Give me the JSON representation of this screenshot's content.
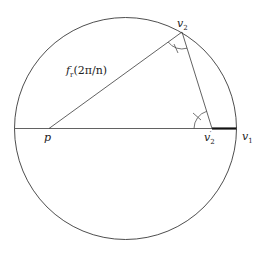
{
  "diagram": {
    "title": "",
    "colors": {
      "stroke": "#3a3a3a",
      "thick_segment": "#111111",
      "background": "#ffffff"
    },
    "circle": {
      "cx": 125.5,
      "cy": 128.5,
      "r": 111
    },
    "points": {
      "p": {
        "x": 49,
        "y": 128.5
      },
      "v2": {
        "x": 182,
        "y": 32
      },
      "v2_prime": {
        "x": 212,
        "y": 128.5
      },
      "v1": {
        "x": 236.5,
        "y": 128.5
      }
    },
    "labels": {
      "p": {
        "base": "p",
        "sub": "",
        "sup": ""
      },
      "v2": {
        "base": "v",
        "sub": "2",
        "sup": ""
      },
      "v2_prime": {
        "base": "v",
        "sub": "2",
        "sup": "′"
      },
      "v1": {
        "base": "v",
        "sub": "1",
        "sup": ""
      },
      "edge_p_v2": {
        "text": "f",
        "sub": "r",
        "rest": "(2π/n)"
      }
    },
    "angle_marks": [
      {
        "at": "v2",
        "description": "angle at v2 between p-v2 and v2-v2' with tick mark"
      },
      {
        "at": "v2_prime",
        "description": "angle at v2' between p-v2' and v2'-v2 with tick mark"
      }
    ],
    "segments": [
      {
        "from": "circle_left",
        "to": "v1",
        "style": "thin",
        "description": "diameter"
      },
      {
        "from": "p",
        "to": "v2",
        "style": "thin"
      },
      {
        "from": "v2",
        "to": "v2_prime",
        "style": "thin"
      },
      {
        "from": "v2_prime",
        "to": "v1",
        "style": "thick"
      }
    ]
  }
}
